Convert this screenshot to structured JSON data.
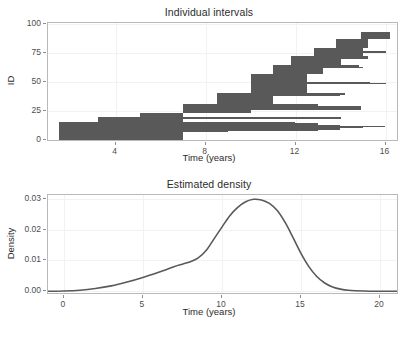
{
  "figure": {
    "background": "#ffffff",
    "bar_color": "#595959",
    "curve_color": "#595959",
    "panel_border_color": "#b9b9b9",
    "grid_color": "#f2f2f2"
  },
  "panels": [
    {
      "id": "individual-intervals",
      "title": "Individual intervals",
      "xlabel": "Time (years)",
      "ylabel": "ID"
    },
    {
      "id": "estimated-density",
      "title": "Estimated density",
      "xlabel": "Time (years)",
      "ylabel": "Density"
    }
  ],
  "chart_data": [
    {
      "type": "bar",
      "orientation": "horizontal",
      "title": "Individual intervals",
      "xlabel": "Time (years)",
      "ylabel": "ID",
      "xlim": [
        1.0,
        16.6
      ],
      "ylim": [
        -1.5,
        101
      ],
      "xticks": [
        4,
        8,
        12,
        16
      ],
      "xtick_labels": [
        "4",
        "8",
        "12",
        "16"
      ],
      "yticks": [
        0,
        25,
        50,
        75,
        100
      ],
      "ytick_labels": [
        "0",
        "25",
        "50",
        "75",
        "100"
      ],
      "grid": "minor-only-faint",
      "legend": "none",
      "description": "One horizontal segment per subject, drawn from interval start (L) to interval end (R), sorted by interval end so the right edges form a rising staircase.",
      "intervals": [
        {
          "id": 1,
          "start": 1.5,
          "end": 7.0
        },
        {
          "id": 2,
          "start": 1.5,
          "end": 7.0
        },
        {
          "id": 3,
          "start": 1.5,
          "end": 7.0
        },
        {
          "id": 4,
          "start": 1.5,
          "end": 7.0
        },
        {
          "id": 5,
          "start": 1.5,
          "end": 7.0
        },
        {
          "id": 6,
          "start": 1.5,
          "end": 7.0
        },
        {
          "id": 7,
          "start": 1.5,
          "end": 7.0
        },
        {
          "id": 8,
          "start": 1.5,
          "end": 9.0
        },
        {
          "id": 9,
          "start": 1.5,
          "end": 13.0
        },
        {
          "id": 10,
          "start": 1.5,
          "end": 14.0
        },
        {
          "id": 11,
          "start": 1.5,
          "end": 15.0
        },
        {
          "id": 12,
          "start": 1.5,
          "end": 16.0
        },
        {
          "id": 13,
          "start": 1.5,
          "end": 14.0
        },
        {
          "id": 14,
          "start": 1.5,
          "end": 13.0
        },
        {
          "id": 15,
          "start": 1.5,
          "end": 12.0
        },
        {
          "id": 16,
          "start": 3.2,
          "end": 7.0
        },
        {
          "id": 17,
          "start": 3.2,
          "end": 7.0
        },
        {
          "id": 18,
          "start": 3.2,
          "end": 7.0
        },
        {
          "id": 19,
          "start": 3.2,
          "end": 14.0
        },
        {
          "id": 20,
          "start": 3.2,
          "end": 14.0
        },
        {
          "id": 21,
          "start": 5.1,
          "end": 7.0
        },
        {
          "id": 22,
          "start": 5.1,
          "end": 7.0
        },
        {
          "id": 23,
          "start": 5.1,
          "end": 7.0
        },
        {
          "id": 24,
          "start": 7.0,
          "end": 10.0
        },
        {
          "id": 25,
          "start": 7.0,
          "end": 10.0
        },
        {
          "id": 26,
          "start": 7.0,
          "end": 10.0
        },
        {
          "id": 27,
          "start": 7.0,
          "end": 14.9
        },
        {
          "id": 28,
          "start": 7.0,
          "end": 14.9
        },
        {
          "id": 29,
          "start": 7.0,
          "end": 14.9
        },
        {
          "id": 30,
          "start": 7.0,
          "end": 13.0
        },
        {
          "id": 31,
          "start": 7.0,
          "end": 13.0
        },
        {
          "id": 32,
          "start": 8.5,
          "end": 11.0
        },
        {
          "id": 33,
          "start": 8.5,
          "end": 11.0
        },
        {
          "id": 34,
          "start": 8.5,
          "end": 11.0
        },
        {
          "id": 35,
          "start": 8.5,
          "end": 11.0
        },
        {
          "id": 36,
          "start": 8.5,
          "end": 11.0
        },
        {
          "id": 37,
          "start": 8.5,
          "end": 11.0
        },
        {
          "id": 38,
          "start": 8.5,
          "end": 11.0
        },
        {
          "id": 39,
          "start": 8.5,
          "end": 14.0
        },
        {
          "id": 40,
          "start": 8.5,
          "end": 14.2
        },
        {
          "id": 41,
          "start": 10.0,
          "end": 12.5
        },
        {
          "id": 42,
          "start": 10.0,
          "end": 12.5
        },
        {
          "id": 43,
          "start": 10.0,
          "end": 12.5
        },
        {
          "id": 44,
          "start": 10.0,
          "end": 12.5
        },
        {
          "id": 45,
          "start": 10.0,
          "end": 12.5
        },
        {
          "id": 46,
          "start": 10.0,
          "end": 12.5
        },
        {
          "id": 47,
          "start": 10.0,
          "end": 12.5
        },
        {
          "id": 48,
          "start": 10.0,
          "end": 12.5
        },
        {
          "id": 49,
          "start": 10.0,
          "end": 16.0
        },
        {
          "id": 50,
          "start": 10.0,
          "end": 15.3
        },
        {
          "id": 51,
          "start": 10.0,
          "end": 12.5
        },
        {
          "id": 52,
          "start": 10.0,
          "end": 12.5
        },
        {
          "id": 53,
          "start": 10.0,
          "end": 12.5
        },
        {
          "id": 54,
          "start": 10.0,
          "end": 12.5
        },
        {
          "id": 55,
          "start": 10.0,
          "end": 12.5
        },
        {
          "id": 56,
          "start": 10.0,
          "end": 12.5
        },
        {
          "id": 57,
          "start": 10.0,
          "end": 12.5
        },
        {
          "id": 58,
          "start": 11.0,
          "end": 13.2
        },
        {
          "id": 59,
          "start": 11.0,
          "end": 13.2
        },
        {
          "id": 60,
          "start": 11.0,
          "end": 13.2
        },
        {
          "id": 61,
          "start": 11.0,
          "end": 13.2
        },
        {
          "id": 62,
          "start": 11.0,
          "end": 13.2
        },
        {
          "id": 63,
          "start": 11.0,
          "end": 15.0
        },
        {
          "id": 64,
          "start": 11.0,
          "end": 14.8
        },
        {
          "id": 65,
          "start": 11.8,
          "end": 14.0
        },
        {
          "id": 66,
          "start": 11.8,
          "end": 14.0
        },
        {
          "id": 67,
          "start": 11.8,
          "end": 14.0
        },
        {
          "id": 68,
          "start": 11.8,
          "end": 14.0
        },
        {
          "id": 69,
          "start": 11.8,
          "end": 14.0
        },
        {
          "id": 70,
          "start": 11.8,
          "end": 14.0
        },
        {
          "id": 71,
          "start": 11.8,
          "end": 15.2
        },
        {
          "id": 72,
          "start": 11.8,
          "end": 15.2
        },
        {
          "id": 73,
          "start": 12.8,
          "end": 15.0
        },
        {
          "id": 74,
          "start": 12.8,
          "end": 15.0
        },
        {
          "id": 75,
          "start": 12.8,
          "end": 15.0
        },
        {
          "id": 76,
          "start": 12.8,
          "end": 16.0
        },
        {
          "id": 77,
          "start": 12.8,
          "end": 15.0
        },
        {
          "id": 78,
          "start": 12.8,
          "end": 15.0
        },
        {
          "id": 79,
          "start": 12.8,
          "end": 15.0
        },
        {
          "id": 80,
          "start": 13.8,
          "end": 15.2
        },
        {
          "id": 81,
          "start": 13.8,
          "end": 15.2
        },
        {
          "id": 82,
          "start": 13.8,
          "end": 15.2
        },
        {
          "id": 83,
          "start": 13.8,
          "end": 15.2
        },
        {
          "id": 84,
          "start": 13.8,
          "end": 15.2
        },
        {
          "id": 85,
          "start": 13.8,
          "end": 15.2
        },
        {
          "id": 86,
          "start": 13.8,
          "end": 15.2
        },
        {
          "id": 87,
          "start": 13.8,
          "end": 15.2
        },
        {
          "id": 88,
          "start": 14.9,
          "end": 16.2
        },
        {
          "id": 89,
          "start": 14.9,
          "end": 16.2
        },
        {
          "id": 90,
          "start": 14.9,
          "end": 16.2
        },
        {
          "id": 91,
          "start": 14.9,
          "end": 16.2
        },
        {
          "id": 92,
          "start": 14.9,
          "end": 16.2
        },
        {
          "id": 93,
          "start": 14.9,
          "end": 16.2
        }
      ]
    },
    {
      "type": "line",
      "title": "Estimated density",
      "xlabel": "Time (years)",
      "ylabel": "Density",
      "xlim": [
        -1.0,
        21.2
      ],
      "ylim": [
        -0.0012,
        0.0312
      ],
      "xticks": [
        0,
        5,
        10,
        15,
        20
      ],
      "xtick_labels": [
        "0",
        "5",
        "10",
        "15",
        "20"
      ],
      "yticks": [
        0.0,
        0.01,
        0.02,
        0.03
      ],
      "ytick_labels": [
        "0.00",
        "0.01",
        "0.02",
        "0.03"
      ],
      "grid": "minor-only-faint",
      "legend": "none",
      "peak_x": 12.0,
      "peak_y": 0.0298,
      "series": [
        {
          "name": "Estimated density",
          "x": [
            -1.0,
            0.0,
            1.0,
            2.0,
            3.0,
            4.0,
            5.0,
            6.0,
            7.0,
            7.5,
            8.0,
            8.5,
            9.0,
            9.5,
            10.0,
            10.5,
            11.0,
            11.5,
            12.0,
            12.5,
            13.0,
            13.5,
            14.0,
            14.5,
            15.0,
            15.5,
            16.0,
            16.5,
            17.0,
            17.5,
            18.0,
            19.0,
            20.0,
            21.2
          ],
          "y": [
            0.0,
            0.0001,
            0.00035,
            0.0009,
            0.00175,
            0.003,
            0.0045,
            0.0062,
            0.008,
            0.0088,
            0.0096,
            0.0108,
            0.0132,
            0.017,
            0.0208,
            0.0245,
            0.0272,
            0.029,
            0.0298,
            0.0296,
            0.0285,
            0.0262,
            0.0223,
            0.0174,
            0.0123,
            0.008,
            0.0048,
            0.0027,
            0.0014,
            0.0007,
            0.00035,
            0.0001,
            2e-05,
            0.0
          ]
        }
      ]
    }
  ]
}
